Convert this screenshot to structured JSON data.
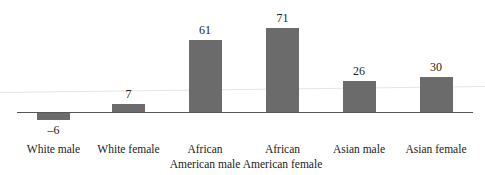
{
  "chart_data": {
    "type": "bar",
    "title": "",
    "xlabel": "",
    "ylabel": "",
    "categories": [
      "White male",
      "White female",
      "African American male",
      "African American female",
      "Asian male",
      "Asian female"
    ],
    "category_lines": [
      [
        "White male"
      ],
      [
        "White female"
      ],
      [
        "African",
        "American male"
      ],
      [
        "African",
        "American female"
      ],
      [
        "Asian male"
      ],
      [
        "Asian female"
      ]
    ],
    "values": [
      -6,
      7,
      61,
      71,
      26,
      30
    ],
    "value_labels": [
      "–6",
      "7",
      "61",
      "71",
      "26",
      "30"
    ],
    "ylim": [
      -10,
      80
    ],
    "grid": false,
    "legend": null,
    "bar_color": "#6b6b6b"
  }
}
